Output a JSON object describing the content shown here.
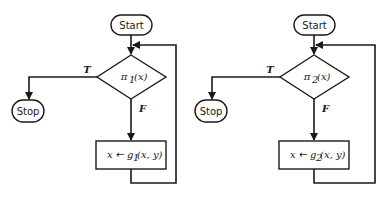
{
  "flowcharts": [
    {
      "start_label": "Start",
      "stop_label": "Stop",
      "predicate": "π",
      "predicate_sub": "1",
      "predicate_arg": "(x)",
      "true_label": "T",
      "false_label": "F",
      "assign_lhs": "x",
      "assign_arrow": "←",
      "assign_fn": "g",
      "assign_sub": "1",
      "assign_args": "(x, y)"
    },
    {
      "start_label": "Start",
      "stop_label": "Stop",
      "predicate": "π",
      "predicate_sub": "2",
      "predicate_arg": "(x)",
      "true_label": "T",
      "false_label": "F",
      "assign_lhs": "x",
      "assign_arrow": "←",
      "assign_fn": "g",
      "assign_sub": "2",
      "assign_args": "(x, y)"
    }
  ]
}
